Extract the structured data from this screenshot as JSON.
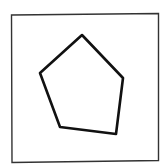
{
  "figure": {
    "shape": "pentagon",
    "frame": {
      "x1": 11.5,
      "y1": 15,
      "x2": 158.5,
      "y2": 13.5,
      "x3": 158.5,
      "y3": 160.5,
      "x4": 12,
      "y4": 162.5,
      "color": "#333333"
    },
    "polygon": {
      "points": "82,35 123,78 116,134 60,127 40,73",
      "stroke": "#111111",
      "fill": "#ffffff"
    }
  }
}
